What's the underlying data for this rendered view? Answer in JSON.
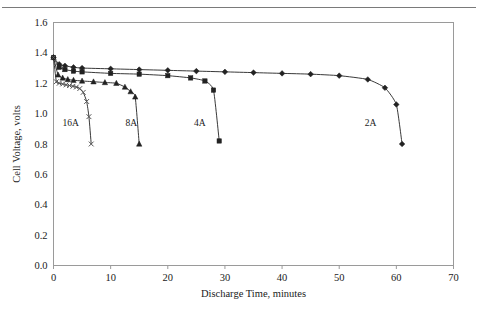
{
  "figure": {
    "background_color": "#ffffff",
    "line_color": "#222222",
    "border_color": "#9a9a9a",
    "top_rule_color": "#7a7a7a"
  },
  "chart_data": {
    "type": "line",
    "title": "",
    "xlabel": "Discharge Time, minutes",
    "ylabel": "Cell Voltage, volts",
    "xlim": [
      0,
      70
    ],
    "ylim": [
      0,
      1.6
    ],
    "xticks": [
      0,
      10,
      20,
      30,
      40,
      50,
      60,
      70
    ],
    "yticks": [
      0.0,
      0.2,
      0.4,
      0.6,
      0.8,
      1.0,
      1.2,
      1.4,
      1.6
    ],
    "xtick_labels": [
      "0",
      "10",
      "20",
      "30",
      "40",
      "50",
      "60",
      "70"
    ],
    "ytick_labels": [
      "0.0",
      "0.2",
      "0.4",
      "0.6",
      "0.8",
      "1.0",
      "1.2",
      "1.4",
      "1.6"
    ],
    "grid": false,
    "legend_position": "inline-annotations",
    "series": [
      {
        "name": "2A",
        "marker": "diamond",
        "label": "2A",
        "label_x": 55.5,
        "label_y": 0.92,
        "x": [
          0.0,
          1.0,
          2.0,
          3.5,
          5.0,
          10.0,
          15.0,
          20.0,
          25.0,
          30.0,
          35.0,
          40.0,
          45.0,
          50.0,
          55.0,
          58.0,
          60.0,
          61.0
        ],
        "y": [
          1.37,
          1.325,
          1.315,
          1.305,
          1.3,
          1.295,
          1.29,
          1.285,
          1.28,
          1.275,
          1.27,
          1.265,
          1.26,
          1.25,
          1.225,
          1.17,
          1.06,
          0.8
        ]
      },
      {
        "name": "4A",
        "marker": "square",
        "label": "4A",
        "label_x": 25.6,
        "label_y": 0.92,
        "x": [
          0.0,
          1.0,
          2.0,
          3.5,
          5.0,
          10.0,
          15.0,
          20.0,
          24.0,
          26.5,
          28.0,
          29.0
        ],
        "y": [
          1.37,
          1.305,
          1.29,
          1.28,
          1.275,
          1.265,
          1.26,
          1.25,
          1.235,
          1.215,
          1.155,
          0.82
        ]
      },
      {
        "name": "8A",
        "marker": "triangle",
        "label": "8A",
        "label_x": 13.6,
        "label_y": 0.92,
        "x": [
          0.0,
          0.8,
          1.6,
          2.5,
          3.5,
          5.0,
          7.0,
          9.0,
          11.0,
          12.5,
          13.5,
          14.3,
          15.0
        ],
        "y": [
          1.37,
          1.255,
          1.235,
          1.225,
          1.22,
          1.215,
          1.21,
          1.205,
          1.2,
          1.175,
          1.145,
          1.11,
          0.8
        ]
      },
      {
        "name": "16A",
        "marker": "cross",
        "label": "16A",
        "label_x": 3.0,
        "label_y": 0.92,
        "x": [
          0.0,
          0.5,
          1.0,
          1.6,
          2.2,
          2.8,
          3.4,
          4.0,
          4.6,
          5.2,
          5.8,
          6.2,
          6.6
        ],
        "y": [
          1.37,
          1.21,
          1.2,
          1.195,
          1.19,
          1.185,
          1.18,
          1.175,
          1.165,
          1.14,
          1.08,
          0.98,
          0.8
        ]
      }
    ]
  }
}
